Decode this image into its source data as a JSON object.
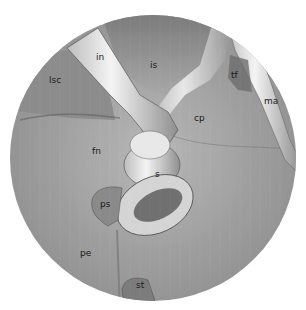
{
  "figure": {
    "background": "#ffffff",
    "field_color": "#9a9a9a",
    "labels": [
      {
        "id": "in",
        "text": "in",
        "x": 96,
        "y": 58
      },
      {
        "id": "is",
        "text": "is",
        "x": 150,
        "y": 66
      },
      {
        "id": "lsc",
        "text": "lsc",
        "x": 49,
        "y": 81
      },
      {
        "id": "tf",
        "text": "tf",
        "x": 231,
        "y": 76
      },
      {
        "id": "ma",
        "text": "ma",
        "x": 264,
        "y": 102
      },
      {
        "id": "cp",
        "text": "cp",
        "x": 194,
        "y": 119
      },
      {
        "id": "fn",
        "text": "fn",
        "x": 92,
        "y": 152
      },
      {
        "id": "s",
        "text": "s",
        "x": 155,
        "y": 175
      },
      {
        "id": "ps",
        "text": "ps",
        "x": 100,
        "y": 205
      },
      {
        "id": "pe",
        "text": "pe",
        "x": 80,
        "y": 254
      },
      {
        "id": "st",
        "text": "st",
        "x": 136,
        "y": 286
      }
    ]
  }
}
